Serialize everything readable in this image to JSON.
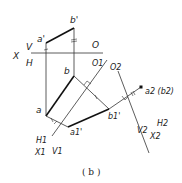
{
  "figure": {
    "caption": "( b )",
    "labels": {
      "a_prime": "a'",
      "b_prime": "b'",
      "X": "X",
      "V": "V",
      "H": "H",
      "O": "O",
      "a": "a",
      "b": "b",
      "O1": "O1",
      "O2": "O2",
      "a1_prime": "a1'",
      "b1_prime": "b1'",
      "H1": "H1",
      "X1": "X1",
      "V1": "V1",
      "a2_b2": "a2 (b2)",
      "H2": "H2",
      "V2": "V2",
      "X2": "X2"
    },
    "colors": {
      "line": "#222222",
      "background": "#ffffff"
    }
  }
}
